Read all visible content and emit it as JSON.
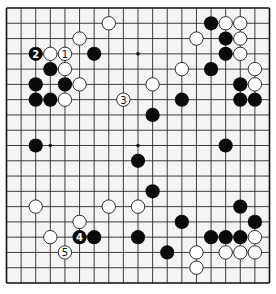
{
  "diagram": {
    "type": "go-board",
    "size": 19,
    "board_color": "#f4f4f4",
    "line_color": "#2a2a2a",
    "star_points": [
      [
        3,
        9
      ],
      [
        9,
        3
      ],
      [
        9,
        9
      ]
    ],
    "stones": [
      {
        "color": "white",
        "col": 7,
        "row": 1
      },
      {
        "color": "white",
        "col": 5,
        "row": 2
      },
      {
        "color": "black",
        "col": 2,
        "row": 3,
        "label": "2"
      },
      {
        "color": "white",
        "col": 3,
        "row": 3
      },
      {
        "color": "white",
        "col": 4,
        "row": 3,
        "label": "1"
      },
      {
        "color": "black",
        "col": 6,
        "row": 3
      },
      {
        "color": "black",
        "col": 3,
        "row": 4
      },
      {
        "color": "white",
        "col": 4,
        "row": 4
      },
      {
        "color": "black",
        "col": 2,
        "row": 5
      },
      {
        "color": "black",
        "col": 4,
        "row": 5
      },
      {
        "color": "white",
        "col": 5,
        "row": 5
      },
      {
        "color": "black",
        "col": 2,
        "row": 6
      },
      {
        "color": "black",
        "col": 3,
        "row": 6
      },
      {
        "color": "white",
        "col": 4,
        "row": 6
      },
      {
        "color": "white",
        "col": 8,
        "row": 6,
        "label": "3"
      },
      {
        "color": "black",
        "col": 2,
        "row": 9
      },
      {
        "color": "black",
        "col": 14,
        "row": 1
      },
      {
        "color": "white",
        "col": 15,
        "row": 1
      },
      {
        "color": "white",
        "col": 16,
        "row": 1
      },
      {
        "color": "white",
        "col": 13,
        "row": 2
      },
      {
        "color": "black",
        "col": 15,
        "row": 2
      },
      {
        "color": "white",
        "col": 16,
        "row": 2
      },
      {
        "color": "black",
        "col": 15,
        "row": 3
      },
      {
        "color": "white",
        "col": 16,
        "row": 3
      },
      {
        "color": "white",
        "col": 12,
        "row": 4
      },
      {
        "color": "black",
        "col": 14,
        "row": 4
      },
      {
        "color": "white",
        "col": 17,
        "row": 4
      },
      {
        "color": "white",
        "col": 10,
        "row": 5
      },
      {
        "color": "black",
        "col": 16,
        "row": 5
      },
      {
        "color": "white",
        "col": 17,
        "row": 5
      },
      {
        "color": "black",
        "col": 12,
        "row": 6
      },
      {
        "color": "black",
        "col": 16,
        "row": 6
      },
      {
        "color": "black",
        "col": 17,
        "row": 6
      },
      {
        "color": "black",
        "col": 10,
        "row": 7
      },
      {
        "color": "black",
        "col": 15,
        "row": 9
      },
      {
        "color": "black",
        "col": 9,
        "row": 10
      },
      {
        "color": "black",
        "col": 10,
        "row": 12
      },
      {
        "color": "white",
        "col": 2,
        "row": 13
      },
      {
        "color": "white",
        "col": 7,
        "row": 13
      },
      {
        "color": "white",
        "col": 9,
        "row": 13
      },
      {
        "color": "black",
        "col": 16,
        "row": 13
      },
      {
        "color": "white",
        "col": 5,
        "row": 14
      },
      {
        "color": "black",
        "col": 12,
        "row": 14
      },
      {
        "color": "black",
        "col": 17,
        "row": 14
      },
      {
        "color": "white",
        "col": 3,
        "row": 15
      },
      {
        "color": "black",
        "col": 5,
        "row": 15,
        "label": "4"
      },
      {
        "color": "black",
        "col": 6,
        "row": 15
      },
      {
        "color": "black",
        "col": 9,
        "row": 15
      },
      {
        "color": "black",
        "col": 14,
        "row": 15
      },
      {
        "color": "black",
        "col": 15,
        "row": 15
      },
      {
        "color": "black",
        "col": 16,
        "row": 15
      },
      {
        "color": "white",
        "col": 17,
        "row": 15
      },
      {
        "color": "white",
        "col": 4,
        "row": 16,
        "label": "5"
      },
      {
        "color": "black",
        "col": 11,
        "row": 16
      },
      {
        "color": "white",
        "col": 13,
        "row": 16
      },
      {
        "color": "white",
        "col": 15,
        "row": 16
      },
      {
        "color": "white",
        "col": 16,
        "row": 16
      },
      {
        "color": "white",
        "col": 17,
        "row": 16
      },
      {
        "color": "white",
        "col": 13,
        "row": 17
      }
    ],
    "move_labels": [
      "1",
      "2",
      "3",
      "4",
      "5"
    ]
  }
}
